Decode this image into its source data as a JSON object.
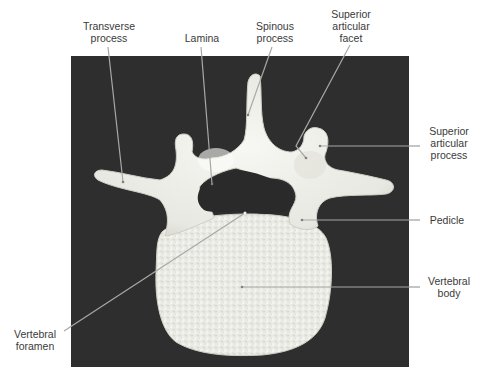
{
  "figure": {
    "background_color": "#2e2e2e",
    "bone_color": "#efefea",
    "leader_color": "#a8a8a8"
  },
  "labels": [
    {
      "id": "transverse-process",
      "lines": [
        "Transverse",
        "process"
      ]
    },
    {
      "id": "lamina",
      "lines": [
        "Lamina"
      ]
    },
    {
      "id": "spinous-process",
      "lines": [
        "Spinous",
        "process"
      ]
    },
    {
      "id": "superior-articular-facet",
      "lines": [
        "Superior",
        "articular",
        "facet"
      ]
    },
    {
      "id": "superior-articular-process",
      "lines": [
        "Superior",
        "articular",
        "process"
      ]
    },
    {
      "id": "pedicle",
      "lines": [
        "Pedicle"
      ]
    },
    {
      "id": "vertebral-body",
      "lines": [
        "Vertebral",
        "body"
      ]
    },
    {
      "id": "vertebral-foramen",
      "lines": [
        "Vertebral",
        "foramen"
      ]
    }
  ]
}
